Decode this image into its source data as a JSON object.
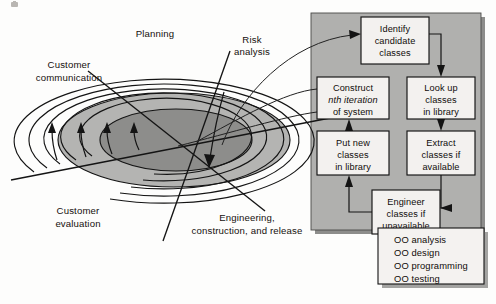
{
  "figure": {
    "background_color": "#fdfdfc"
  },
  "spiral": {
    "labels": [
      {
        "id": "planning",
        "text": "Planning",
        "x": 155,
        "y": 37
      },
      {
        "id": "risk-analysis-line1",
        "text": "Risk",
        "x": 252,
        "y": 43
      },
      {
        "id": "risk-analysis-line2",
        "text": "analysis",
        "x": 252,
        "y": 55
      },
      {
        "id": "customer-communication-line1",
        "text": "Customer",
        "x": 69,
        "y": 68
      },
      {
        "id": "customer-communication-line2",
        "text": "communication",
        "x": 69,
        "y": 81
      },
      {
        "id": "customer-evaluation-line1",
        "text": "Customer",
        "x": 78,
        "y": 214
      },
      {
        "id": "customer-evaluation-line2",
        "text": "evaluation",
        "x": 78,
        "y": 227
      },
      {
        "id": "engineering-line1",
        "text": "Engineering,",
        "x": 247,
        "y": 221
      },
      {
        "id": "engineering-line2",
        "text": "construction, and release",
        "x": 247,
        "y": 234
      }
    ],
    "ring_count": 5,
    "shaded_rings": [
      {
        "id": "inner-core",
        "color": "#8d8d8b"
      },
      {
        "id": "mid-ring",
        "color": "#b4b4b2"
      }
    ],
    "direction_arrow_count": 4
  },
  "panel": {
    "background_color": "#b0b0ae",
    "shadow_color": "#8d8d8b",
    "boxes": [
      {
        "id": "identify-candidate-classes",
        "lines": [
          "Identify",
          "candidate",
          "classes"
        ],
        "x": 361,
        "y": 17,
        "w": 68,
        "h": 47
      },
      {
        "id": "look-up-classes-in-library",
        "lines": [
          "Look up",
          "classes",
          "in library"
        ],
        "x": 407,
        "y": 77,
        "w": 68,
        "h": 42
      },
      {
        "id": "construct-nth-iteration-of-system",
        "lines": [
          "Construct",
          "nth iteration",
          "of system"
        ],
        "italic_line": 1,
        "x": 317,
        "y": 77,
        "w": 72,
        "h": 42
      },
      {
        "id": "extract-classes-if-available",
        "lines": [
          "Extract",
          "classes if",
          "available"
        ],
        "x": 407,
        "y": 131,
        "w": 68,
        "h": 44
      },
      {
        "id": "put-new-classes-in-library",
        "lines": [
          "Put new",
          "classes",
          "in library"
        ],
        "x": 317,
        "y": 131,
        "w": 72,
        "h": 44
      },
      {
        "id": "engineer-classes-if-unavailable",
        "lines": [
          "Engineer",
          "classes if",
          "unavailable"
        ],
        "x": 372,
        "y": 190,
        "w": 68,
        "h": 44
      }
    ]
  },
  "legend": {
    "id": "oo-activities-legend",
    "x": 378,
    "y": 228,
    "w": 106,
    "h": 56,
    "items": [
      "OO analysis",
      "OO design",
      "OO programming",
      "OO testing"
    ]
  }
}
